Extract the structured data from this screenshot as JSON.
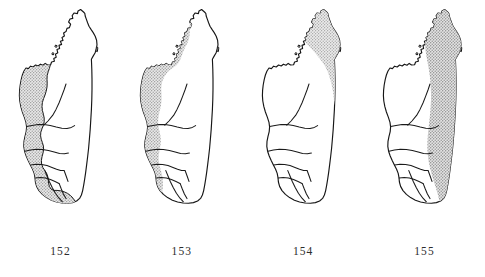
{
  "figure": {
    "title": "",
    "background_color": "#ffffff",
    "outline_color": "#161616",
    "shade_color": "#9a9a9a",
    "label_color": "#2c2c2c",
    "panel_count": 4
  },
  "panels": [
    {
      "label": "152",
      "name": "map-panel-152",
      "range_region": "west and southwest coastal belt",
      "shading_style": "stipple",
      "shading_outlined": true
    },
    {
      "label": "153",
      "name": "map-panel-153",
      "range_region": "narrow west coastal strip extending to northwest",
      "shading_style": "stipple",
      "shading_outlined": false
    },
    {
      "label": "154",
      "name": "map-panel-154",
      "range_region": "northeast wedge",
      "shading_style": "stipple",
      "shading_outlined": false
    },
    {
      "label": "155",
      "name": "map-panel-155",
      "range_region": "east coastal belt full length",
      "shading_style": "stipple",
      "shading_outlined": false
    }
  ]
}
